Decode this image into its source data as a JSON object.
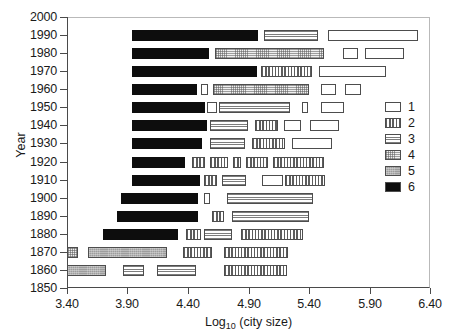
{
  "chart_data": {
    "type": "bar",
    "title": "",
    "subtitle": "",
    "xlabel": "Log10 (city size)",
    "xlabel_base": "Log",
    "xlabel_sub": "10",
    "xlabel_rest": " (city size)",
    "ylabel": "Year",
    "xlim": [
      3.4,
      6.4
    ],
    "ylim": [
      1850,
      2000
    ],
    "x_ticks": [
      "3.40",
      "3.90",
      "4.40",
      "4.90",
      "5.40",
      "5.90",
      "6.40"
    ],
    "x_tick_values": [
      3.4,
      3.9,
      4.4,
      4.9,
      5.4,
      5.9,
      6.4
    ],
    "y_ticks": [
      "2000",
      "1990",
      "1980",
      "1970",
      "1960",
      "1950",
      "1940",
      "1930",
      "1920",
      "1910",
      "1900",
      "1890",
      "1880",
      "1870",
      "1860",
      "1850"
    ],
    "y_tick_values": [
      2000,
      1990,
      1980,
      1970,
      1960,
      1950,
      1940,
      1930,
      1920,
      1910,
      1900,
      1890,
      1880,
      1870,
      1860,
      1850
    ],
    "grid": false,
    "orientation": "horizontal",
    "legend_position": "right",
    "legend": [
      {
        "label": "1",
        "pattern": "empty-white"
      },
      {
        "label": "2",
        "pattern": "vertical-hatch"
      },
      {
        "label": "3",
        "pattern": "horizontal-hatch"
      },
      {
        "label": "4",
        "pattern": "light-stipple"
      },
      {
        "label": "5",
        "pattern": "solid-gray"
      },
      {
        "label": "6",
        "pattern": "solid-black"
      }
    ],
    "series": [
      {
        "name": "1",
        "pattern": "empty-white"
      },
      {
        "name": "2",
        "pattern": "vertical-hatch"
      },
      {
        "name": "3",
        "pattern": "horizontal-hatch"
      },
      {
        "name": "4",
        "pattern": "light-stipple"
      },
      {
        "name": "5",
        "pattern": "solid-gray"
      },
      {
        "name": "6",
        "pattern": "solid-black"
      }
    ],
    "rows": [
      {
        "year": 1990,
        "segments": [
          {
            "group": 6,
            "x0": 3.94,
            "x1": 4.98
          },
          {
            "group": 3,
            "x0": 5.03,
            "x1": 5.48
          },
          {
            "group": 1,
            "x0": 5.56,
            "x1": 6.3
          }
        ]
      },
      {
        "year": 1980,
        "segments": [
          {
            "group": 6,
            "x0": 3.94,
            "x1": 4.58
          },
          {
            "group": 4,
            "x0": 4.62,
            "x1": 5.52
          },
          {
            "group": 1,
            "x0": 5.68,
            "x1": 5.8
          },
          {
            "group": 1,
            "x0": 5.86,
            "x1": 6.18
          }
        ]
      },
      {
        "year": 1970,
        "segments": [
          {
            "group": 6,
            "x0": 3.94,
            "x1": 4.97
          },
          {
            "group": 2,
            "x0": 5.0,
            "x1": 5.42
          },
          {
            "group": 1,
            "x0": 5.48,
            "x1": 6.03
          }
        ]
      },
      {
        "year": 1960,
        "segments": [
          {
            "group": 6,
            "x0": 3.94,
            "x1": 4.48
          },
          {
            "group": 1,
            "x0": 4.51,
            "x1": 4.57
          },
          {
            "group": 4,
            "x0": 4.61,
            "x1": 5.4
          },
          {
            "group": 1,
            "x0": 5.5,
            "x1": 5.62
          },
          {
            "group": 1,
            "x0": 5.7,
            "x1": 5.83
          }
        ]
      },
      {
        "year": 1950,
        "segments": [
          {
            "group": 6,
            "x0": 3.94,
            "x1": 4.54
          },
          {
            "group": 1,
            "x0": 4.56,
            "x1": 4.64
          },
          {
            "group": 3,
            "x0": 4.66,
            "x1": 5.25
          },
          {
            "group": 1,
            "x0": 5.34,
            "x1": 5.39
          },
          {
            "group": 1,
            "x0": 5.5,
            "x1": 5.69
          }
        ]
      },
      {
        "year": 1940,
        "segments": [
          {
            "group": 6,
            "x0": 3.94,
            "x1": 4.56
          },
          {
            "group": 3,
            "x0": 4.58,
            "x1": 4.89
          },
          {
            "group": 2,
            "x0": 4.95,
            "x1": 5.14
          },
          {
            "group": 1,
            "x0": 5.19,
            "x1": 5.33
          },
          {
            "group": 1,
            "x0": 5.41,
            "x1": 5.65
          }
        ]
      },
      {
        "year": 1930,
        "segments": [
          {
            "group": 6,
            "x0": 3.94,
            "x1": 4.52
          },
          {
            "group": 3,
            "x0": 4.58,
            "x1": 4.87
          },
          {
            "group": 2,
            "x0": 4.93,
            "x1": 5.2
          },
          {
            "group": 1,
            "x0": 5.26,
            "x1": 5.59
          }
        ]
      },
      {
        "year": 1920,
        "segments": [
          {
            "group": 6,
            "x0": 3.94,
            "x1": 4.38
          },
          {
            "group": 2,
            "x0": 4.43,
            "x1": 4.54
          },
          {
            "group": 2,
            "x0": 4.58,
            "x1": 4.73
          },
          {
            "group": 2,
            "x0": 4.77,
            "x1": 4.84
          },
          {
            "group": 2,
            "x0": 4.88,
            "x1": 5.06
          },
          {
            "group": 2,
            "x0": 5.1,
            "x1": 5.52
          }
        ]
      },
      {
        "year": 1910,
        "segments": [
          {
            "group": 6,
            "x0": 3.94,
            "x1": 4.5
          },
          {
            "group": 2,
            "x0": 4.53,
            "x1": 4.64
          },
          {
            "group": 3,
            "x0": 4.68,
            "x1": 4.88
          },
          {
            "group": 1,
            "x0": 5.01,
            "x1": 5.18
          },
          {
            "group": 2,
            "x0": 5.2,
            "x1": 5.53
          }
        ]
      },
      {
        "year": 1900,
        "segments": [
          {
            "group": 6,
            "x0": 3.85,
            "x1": 4.49
          },
          {
            "group": 1,
            "x0": 4.53,
            "x1": 4.58
          },
          {
            "group": 3,
            "x0": 4.72,
            "x1": 5.43
          }
        ]
      },
      {
        "year": 1890,
        "segments": [
          {
            "group": 6,
            "x0": 3.81,
            "x1": 4.48
          },
          {
            "group": 2,
            "x0": 4.6,
            "x1": 4.7
          },
          {
            "group": 3,
            "x0": 4.76,
            "x1": 5.4
          }
        ]
      },
      {
        "year": 1880,
        "segments": [
          {
            "group": 6,
            "x0": 3.7,
            "x1": 4.32
          },
          {
            "group": 2,
            "x0": 4.38,
            "x1": 4.5
          },
          {
            "group": 3,
            "x0": 4.53,
            "x1": 4.76
          },
          {
            "group": 2,
            "x0": 4.84,
            "x1": 5.35
          }
        ]
      },
      {
        "year": 1870,
        "segments": [
          {
            "group": 4,
            "x0": 3.4,
            "x1": 3.49
          },
          {
            "group": 5,
            "x0": 3.57,
            "x1": 4.22
          },
          {
            "group": 2,
            "x0": 4.36,
            "x1": 4.6
          },
          {
            "group": 2,
            "x0": 4.7,
            "x1": 5.23
          }
        ]
      },
      {
        "year": 1860,
        "segments": [
          {
            "group": 5,
            "x0": 3.4,
            "x1": 3.72
          },
          {
            "group": 3,
            "x0": 3.86,
            "x1": 4.03
          },
          {
            "group": 3,
            "x0": 4.14,
            "x1": 4.46
          },
          {
            "group": 2,
            "x0": 4.7,
            "x1": 5.22
          }
        ]
      }
    ]
  }
}
